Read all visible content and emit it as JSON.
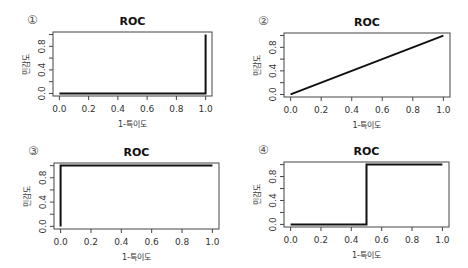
{
  "chart_data": [
    {
      "panel_label": "①",
      "type": "line",
      "title": "ROC",
      "xlabel": "1-특이도",
      "ylabel": "민감도",
      "xlim": [
        0,
        1
      ],
      "ylim": [
        0,
        1
      ],
      "xticks": [
        "0.0",
        "0.2",
        "0.4",
        "0.6",
        "0.8",
        "1.0"
      ],
      "yticks": [
        "0.0",
        "0.4",
        "0.8"
      ],
      "grid": false,
      "x": [
        0,
        1,
        1
      ],
      "y": [
        0,
        0,
        1
      ],
      "box": {
        "left": 53,
        "top": 32,
        "right": 212,
        "bottom": 96
      }
    },
    {
      "panel_label": "②",
      "type": "line",
      "title": "ROC",
      "xlabel": "1-특이도",
      "ylabel": "민감도",
      "xlim": [
        0,
        1
      ],
      "ylim": [
        0,
        1
      ],
      "xticks": [
        "0.0",
        "0.2",
        "0.4",
        "0.6",
        "0.8",
        "1.0"
      ],
      "yticks": [
        "0.0",
        "0.4",
        "0.8"
      ],
      "grid": false,
      "x": [
        0,
        1
      ],
      "y": [
        0,
        1
      ],
      "box": {
        "left": 284,
        "top": 33,
        "right": 450,
        "bottom": 97
      }
    },
    {
      "panel_label": "③",
      "type": "line",
      "title": "ROC",
      "xlabel": "1-특이도",
      "ylabel": "민감도",
      "xlim": [
        0,
        1
      ],
      "ylim": [
        0,
        1
      ],
      "xticks": [
        "0.0",
        "0.2",
        "0.4",
        "0.6",
        "0.8",
        "1.0"
      ],
      "yticks": [
        "0.0",
        "0.4",
        "0.8"
      ],
      "grid": false,
      "x": [
        0,
        0,
        1
      ],
      "y": [
        0,
        1,
        1
      ],
      "box": {
        "left": 54,
        "top": 163,
        "right": 219,
        "bottom": 229
      }
    },
    {
      "panel_label": "④",
      "type": "line",
      "title": "ROC",
      "xlabel": "1-특이도",
      "ylabel": "민감도",
      "xlim": [
        0,
        1
      ],
      "ylim": [
        0,
        1
      ],
      "xticks": [
        "0.0",
        "0.2",
        "0.4",
        "0.6",
        "0.8",
        "1.0"
      ],
      "yticks": [
        "0.0",
        "0.4",
        "0.8"
      ],
      "grid": false,
      "x": [
        0,
        0.5,
        0.5,
        1
      ],
      "y": [
        0,
        0,
        1,
        1
      ],
      "box": {
        "left": 284,
        "top": 162,
        "right": 449,
        "bottom": 227
      }
    }
  ],
  "colors": {
    "line": "#111111",
    "axis": "#444444",
    "background": "#ffffff"
  }
}
